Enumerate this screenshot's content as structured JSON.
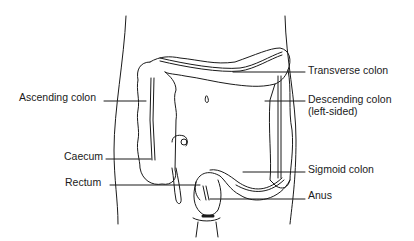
{
  "diagram": {
    "type": "anatomical-illustration",
    "colors": {
      "line": "#1a1a1a",
      "background": "#ffffff"
    },
    "labels": {
      "ascending_colon": "Ascending colon",
      "transverse_colon": "Transverse colon",
      "descending_colon": "Descending colon",
      "descending_colon_note": "(left-sided)",
      "caecum": "Caecum",
      "rectum": "Rectum",
      "sigmoid_colon": "Sigmoid colon",
      "anus": "Anus"
    }
  }
}
